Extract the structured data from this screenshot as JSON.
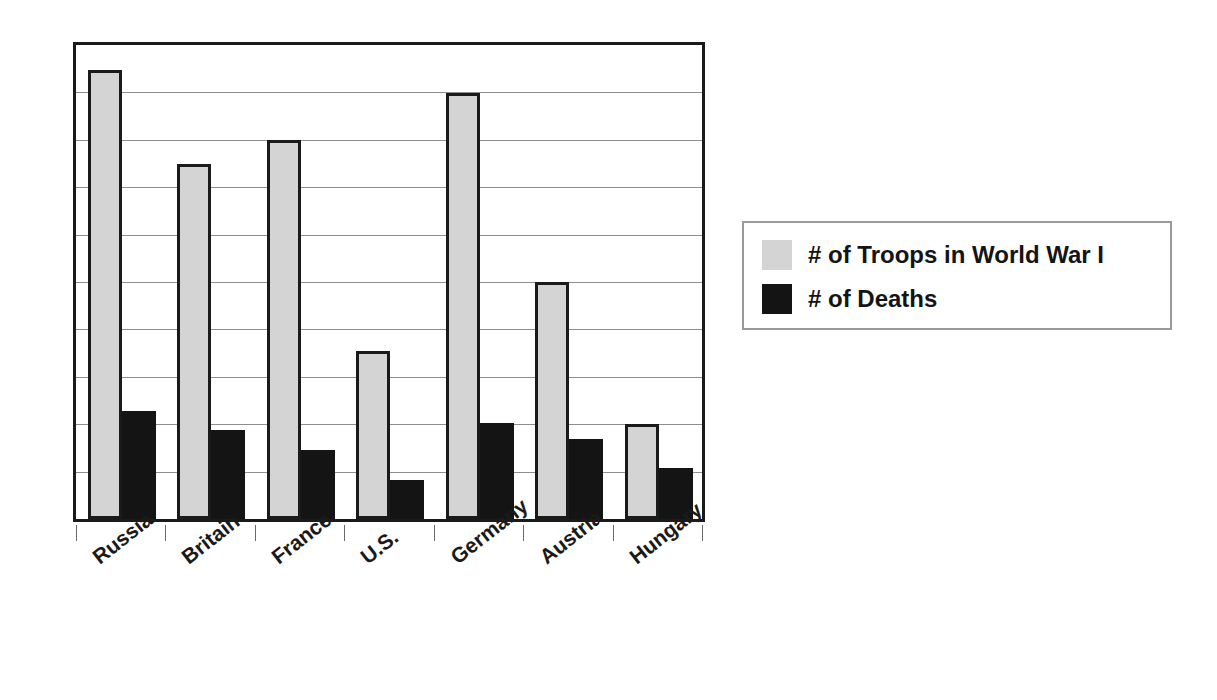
{
  "chart_data": {
    "type": "bar",
    "title": "",
    "subtitle": "",
    "xlabel": "",
    "ylabel": "",
    "categories": [
      "Russia",
      "Britain",
      "France",
      "U.S.",
      "Germany",
      "Austria",
      "Hungary"
    ],
    "series": [
      {
        "name": "# of Troops in World War I",
        "color": "#d4d4d4",
        "values": [
          0.947,
          0.75,
          0.8,
          0.354,
          0.898,
          0.5,
          0.2
        ]
      },
      {
        "name": "# of Deaths",
        "color": "#141414",
        "values": [
          0.227,
          0.188,
          0.146,
          0.083,
          0.202,
          0.169,
          0.108
        ]
      }
    ],
    "ylim": [
      0,
      1
    ],
    "yticks": [
      0,
      0.1,
      0.2,
      0.3,
      0.4,
      0.5,
      0.6,
      0.7,
      0.8,
      0.9,
      1.0
    ],
    "ytick_labels": [
      "",
      "",
      "",
      "",
      "",
      "",
      "",
      "",
      "",
      "",
      ""
    ],
    "grid": true,
    "grid_axis": "y",
    "gridline_count": 9,
    "legend_position": "right",
    "axis_line_color": "#1a1a1a",
    "gridline_color": "#8e8e8e",
    "background_color": "#ffffff"
  },
  "legend": {
    "items": [
      {
        "label": "# of Troops in World War I",
        "swatch": "light-gray-swatch"
      },
      {
        "label": "# of Deaths",
        "swatch": "black-swatch"
      }
    ]
  },
  "axis": {
    "categories": [
      "Russia",
      "Britain",
      "France",
      "U.S.",
      "Germany",
      "Austria",
      "Hungary"
    ]
  }
}
